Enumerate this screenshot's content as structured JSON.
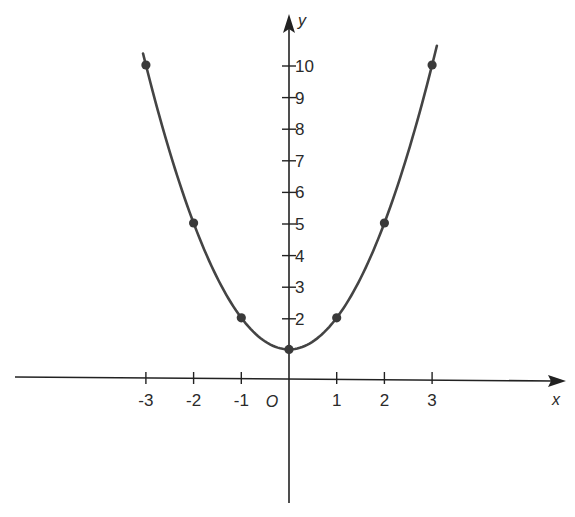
{
  "chart_data": {
    "type": "line",
    "title": "",
    "function": "y = x^2 + 1",
    "xlabel": "x",
    "ylabel": "y",
    "origin_label": "O",
    "x_ticks": [
      -3,
      -2,
      -1,
      1,
      2,
      3
    ],
    "x_tick_labels": [
      "-3",
      "-2",
      "-1",
      "1",
      "2",
      "3"
    ],
    "y_ticks": [
      2,
      3,
      4,
      5,
      6,
      7,
      8,
      9,
      10
    ],
    "y_tick_labels": [
      "2",
      "3",
      "4",
      "5",
      "6",
      "7",
      "8",
      "9",
      "10"
    ],
    "xlim": [
      -5.8,
      5.5
    ],
    "ylim": [
      -3.9,
      10.6
    ],
    "grid": false,
    "legend": null,
    "series": [
      {
        "name": "y = x^2 + 1",
        "x": [
          -3,
          -2,
          -1,
          0,
          1,
          2,
          3
        ],
        "y": [
          10,
          5,
          2,
          1,
          2,
          5,
          10
        ],
        "markers": true,
        "curve_extent_x": [
          -3.06,
          3.1
        ]
      }
    ]
  },
  "style": {
    "line_color": "#444444",
    "axis_color": "#222222",
    "marker_color": "#3a3a3a"
  }
}
